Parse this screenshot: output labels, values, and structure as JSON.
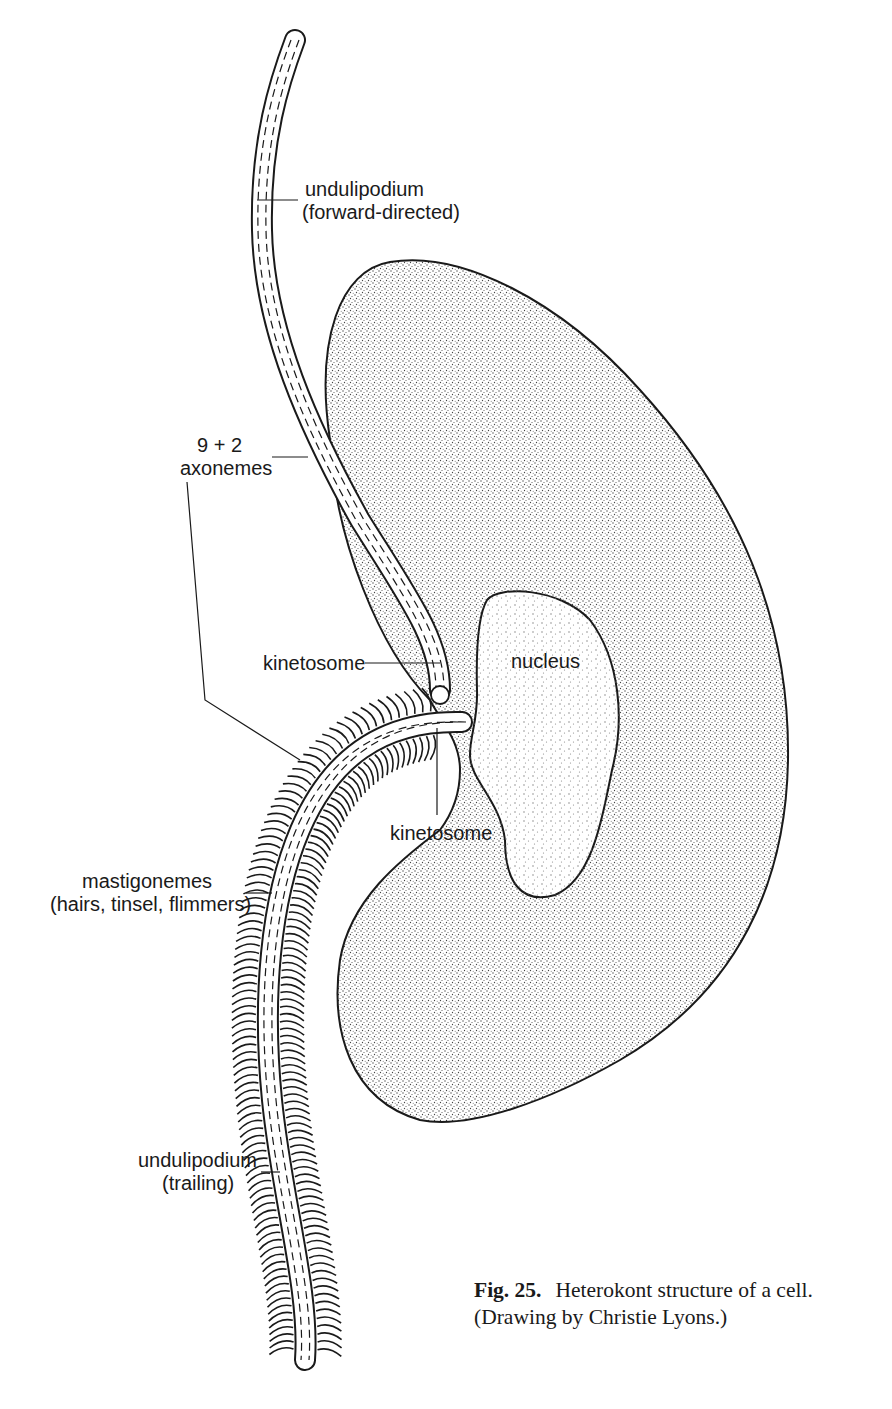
{
  "figure": {
    "title": "Heterokont structure of a cell",
    "labels": {
      "forward_flagellum": [
        "undulipodium",
        "(forward-directed)"
      ],
      "axonemes": [
        "9 + 2",
        "axonemes"
      ],
      "kinetosome_upper": "kinetosome",
      "nucleus": "nucleus",
      "kinetosome_lower": "kinetosome",
      "mastigonemes": [
        "mastigonemes",
        "(hairs, tinsel, flimmers)"
      ],
      "trailing_flagellum": [
        "undulipodium",
        "(trailing)"
      ]
    },
    "colors": {
      "ink": "#1a1a1a",
      "cytoplasm_stipple": "#555555",
      "nucleus_stipple": "#8a8a8a",
      "background": "#ffffff"
    }
  },
  "caption": {
    "fig_number": "Fig. 25.",
    "text": "Heterokont structure of a cell.",
    "credit": "(Drawing by Christie Lyons.)"
  }
}
